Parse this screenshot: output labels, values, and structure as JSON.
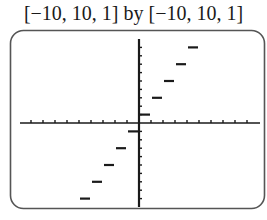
{
  "window_label": "[−10, 10, 1] by [−10, 10, 1]",
  "caption": "",
  "colors": {
    "stroke": "#1a1a1a",
    "frame": "#555555",
    "background": "#ffffff"
  },
  "chart_data": {
    "type": "line",
    "subtype": "step-function",
    "title": "[−10, 10, 1] by [−10, 10, 1]",
    "function": "y = 2⌊x⌋ + 1",
    "xlabel": "",
    "ylabel": "",
    "xlim": [
      -10,
      10
    ],
    "ylim": [
      -10,
      10
    ],
    "xscl": 1,
    "yscl": 1,
    "grid": false,
    "legend": null,
    "segments": [
      {
        "x": [
          -5,
          -4
        ],
        "y": -9
      },
      {
        "x": [
          -4,
          -3
        ],
        "y": -7
      },
      {
        "x": [
          -3,
          -2
        ],
        "y": -5
      },
      {
        "x": [
          -2,
          -1
        ],
        "y": -3
      },
      {
        "x": [
          -1,
          0
        ],
        "y": -1
      },
      {
        "x": [
          0,
          1
        ],
        "y": 1
      },
      {
        "x": [
          1,
          2
        ],
        "y": 3
      },
      {
        "x": [
          2,
          3
        ],
        "y": 5
      },
      {
        "x": [
          3,
          4
        ],
        "y": 7
      },
      {
        "x": [
          4,
          5
        ],
        "y": 9
      }
    ]
  }
}
